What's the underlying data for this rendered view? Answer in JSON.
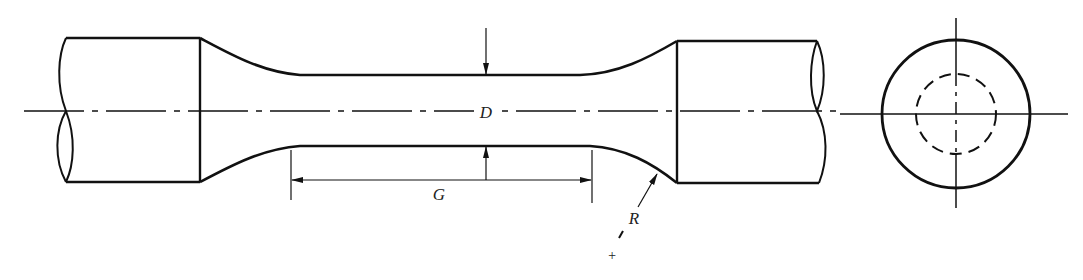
{
  "figure": {
    "colors": {
      "line": "#111111",
      "background": "#ffffff",
      "label": "#222222"
    },
    "labels": {
      "diameter": "D",
      "gauge_length": "G",
      "radius": "R",
      "radius_center": "+"
    },
    "views": [
      "side-elevation",
      "end-view"
    ]
  }
}
